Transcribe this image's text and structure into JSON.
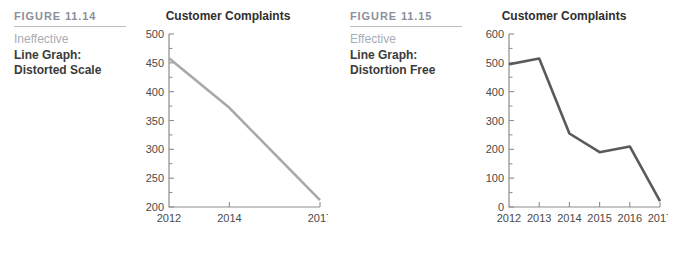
{
  "page": {
    "background": "#ffffff"
  },
  "figures": [
    {
      "number": "FIGURE 11.14",
      "evaluation": "Ineffective",
      "desc_line1": "Line Graph:",
      "desc_line2": "Distorted Scale",
      "number_color": "#8a9099",
      "evaluation_color": "#a7adb4",
      "chart_data": {
        "type": "line",
        "title": "Customer Complaints",
        "xlabel": "",
        "ylabel": "",
        "categories": [
          "2012",
          "2014",
          "2017"
        ],
        "x_tick_labels": [
          "2012",
          "2014",
          "2017"
        ],
        "y_tick_labels": [
          "200",
          "250",
          "300",
          "350",
          "400",
          "450",
          "500"
        ],
        "y_ticks": [
          200,
          250,
          300,
          350,
          400,
          450,
          500
        ],
        "y_minor_ticks": [
          225,
          275,
          325,
          375,
          425,
          475
        ],
        "ylim": [
          200,
          500
        ],
        "xlim": [
          2012,
          2017
        ],
        "grid": false,
        "legend": false,
        "line_color": "#a9a9a9",
        "line_width": 2.6,
        "series": [
          {
            "name": "Customer Complaints",
            "x": [
              2012,
              2014,
              2017
            ],
            "values": [
              458,
              372,
              212
            ]
          }
        ]
      }
    },
    {
      "number": "FIGURE 11.15",
      "evaluation": "Effective",
      "desc_line1": "Line Graph:",
      "desc_line2": "Distortion Free",
      "number_color": "#8a9099",
      "evaluation_color": "#a7adb4",
      "chart_data": {
        "type": "line",
        "title": "Customer Complaints",
        "xlabel": "",
        "ylabel": "",
        "categories": [
          "2012",
          "2013",
          "2014",
          "2015",
          "2016",
          "2017"
        ],
        "x_tick_labels": [
          "2012",
          "2013",
          "2014",
          "2015",
          "2016",
          "2017"
        ],
        "y_tick_labels": [
          "0",
          "100",
          "200",
          "300",
          "400",
          "500",
          "600"
        ],
        "y_ticks": [
          0,
          100,
          200,
          300,
          400,
          500,
          600
        ],
        "y_minor_ticks": [
          50,
          150,
          250,
          350,
          450,
          550
        ],
        "ylim": [
          0,
          600
        ],
        "xlim": [
          2012,
          2017
        ],
        "grid": false,
        "legend": false,
        "line_color": "#5a5a5a",
        "line_width": 2.6,
        "series": [
          {
            "name": "Customer Complaints",
            "x": [
              2012,
              2013,
              2014,
              2015,
              2016,
              2017
            ],
            "values": [
              495,
              515,
              255,
              190,
              210,
              20
            ]
          }
        ]
      }
    }
  ]
}
